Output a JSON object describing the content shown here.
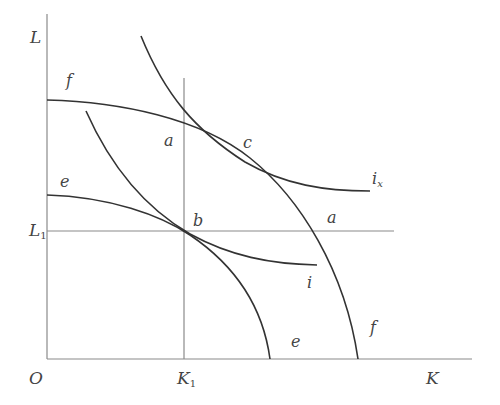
{
  "diagram": {
    "type": "production-possibility-and-isoquant-diagram",
    "axes": {
      "origin_label": "O",
      "x_label": "K",
      "y_label": "L"
    },
    "reference_lines": {
      "k1_label": "K",
      "k1_sub": "1",
      "l1_label": "L",
      "l1_sub": "1"
    },
    "curves": {
      "outer_frontier_label_top": "f",
      "outer_frontier_label_bottom": "f",
      "inner_frontier_label_top": "e",
      "inner_frontier_label_bottom": "e",
      "upper_isoquant_label": "i",
      "upper_isoquant_sub": "x",
      "lower_isoquant_label": "i"
    },
    "points": {
      "a_left": "a",
      "a_right": "a",
      "b": "b",
      "c": "c"
    },
    "colors": {
      "curve": "#333333",
      "axis": "#8a8a8a",
      "label": "#444444"
    }
  }
}
